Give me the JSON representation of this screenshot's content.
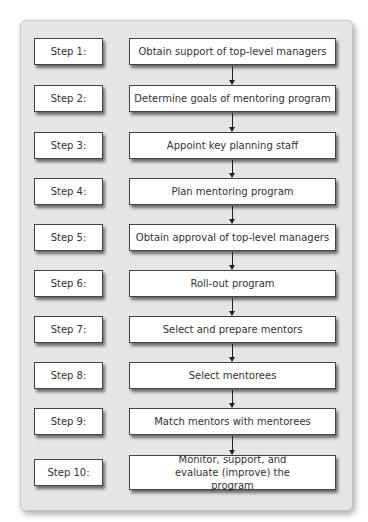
{
  "steps": [
    {
      "label": "Step 1:",
      "action": "Obtain support of top-level managers"
    },
    {
      "label": "Step 2:",
      "action": "Determine goals of mentoring program"
    },
    {
      "label": "Step 3:",
      "action": "Appoint key planning staff"
    },
    {
      "label": "Step 4:",
      "action": "Plan mentoring program"
    },
    {
      "label": "Step 5:",
      "action": "Obtain approval of top-level managers"
    },
    {
      "label": "Step 6:",
      "action": "Roll-out program"
    },
    {
      "label": "Step 7:",
      "action": "Select and prepare mentors"
    },
    {
      "label": "Step 8:",
      "action": "Select mentorees"
    },
    {
      "label": "Step 9:",
      "action": "Match mentors with mentorees"
    },
    {
      "label": "Step 10:",
      "action": "Monitor, support, and evaluate (improve) the program"
    }
  ]
}
